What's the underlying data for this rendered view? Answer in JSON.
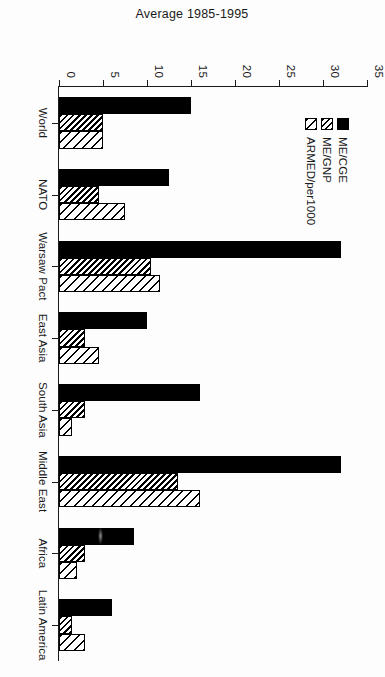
{
  "chart_data": {
    "type": "bar",
    "title": "",
    "subtitle": "",
    "xlabel": "",
    "ylabel": "Average 1985-1995",
    "ylim": [
      0,
      35
    ],
    "yticks": [
      "0",
      "5",
      "10",
      "15",
      "20",
      "25",
      "30",
      "35"
    ],
    "ytick_values": [
      0,
      5,
      10,
      15,
      20,
      25,
      30,
      35
    ],
    "grid": false,
    "legend_position": "upper-left-inside",
    "orientation": "rotated-90-clockwise",
    "categories": [
      "World",
      "NATO",
      "Warsaw Pact",
      "East Asia",
      "South Asia",
      "Middle East",
      "Africa",
      "Latin America"
    ],
    "series": [
      {
        "name": "ME/CGE",
        "fill": "solid-black",
        "values": [
          15.0,
          12.5,
          32.0,
          10.0,
          16.0,
          32.0,
          8.5,
          6.0
        ]
      },
      {
        "name": "ME/GNP",
        "fill": "dense-hatch",
        "values": [
          5.0,
          4.5,
          10.5,
          3.0,
          3.0,
          13.5,
          3.0,
          1.5
        ]
      },
      {
        "name": "ARMED/per1000",
        "fill": "sparse-hatch",
        "values": [
          5.0,
          7.5,
          11.5,
          4.5,
          1.5,
          16.0,
          2.0,
          3.0
        ]
      }
    ]
  },
  "legend": {
    "items": [
      {
        "label": "ME/CGE"
      },
      {
        "label": "ME/GNP"
      },
      {
        "label": "ARMED/per1000"
      }
    ]
  },
  "colors": {
    "axis": "#1a1a1a",
    "bar_outline": "#000000",
    "series_me_cge": "#000000",
    "background": "#ffffff"
  }
}
